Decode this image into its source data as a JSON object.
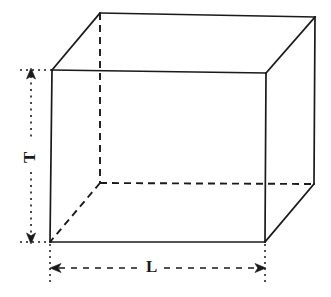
{
  "figure": {
    "shape": "cuboid",
    "style": {
      "line_color": "#1a1a1a",
      "background": "#ffffff",
      "visible_edge_style": "solid",
      "hidden_edge_style": "dashed",
      "dimension_line_style": "dashed-and-dotted-with-arrowheads"
    },
    "labels": {
      "height": "T",
      "length": "L"
    },
    "annotations": [
      {
        "name": "height-dimension",
        "label": "T",
        "orientation": "vertical",
        "label_rotation_deg": -90,
        "arrowheads": "both-ends",
        "line_style": "dotted"
      },
      {
        "name": "length-dimension",
        "label": "L",
        "orientation": "horizontal",
        "label_rotation_deg": 0,
        "arrowheads": "both-ends",
        "line_style": "dashed"
      }
    ],
    "vertices": {
      "front_top_left": [
        52,
        70
      ],
      "front_top_right": [
        266,
        73
      ],
      "front_bottom_right": [
        265,
        242
      ],
      "front_bottom_left": [
        50,
        242
      ],
      "back_top_left": [
        100,
        13
      ],
      "back_top_right": [
        315,
        17
      ],
      "back_bottom_right": [
        314,
        184
      ],
      "back_bottom_left": [
        100,
        183
      ]
    },
    "edges": {
      "visible": [
        "front_top_left-front_top_right",
        "front_top_right-front_bottom_right",
        "front_bottom_right-front_bottom_left",
        "front_bottom_left-front_top_left",
        "front_top_left-back_top_left",
        "front_top_right-back_top_right",
        "back_top_left-back_top_right",
        "back_top_right-back_bottom_right",
        "back_bottom_right-front_bottom_right"
      ],
      "hidden": [
        "back_top_left-back_bottom_left",
        "back_bottom_left-back_bottom_right",
        "back_bottom_left-front_bottom_left"
      ]
    }
  }
}
